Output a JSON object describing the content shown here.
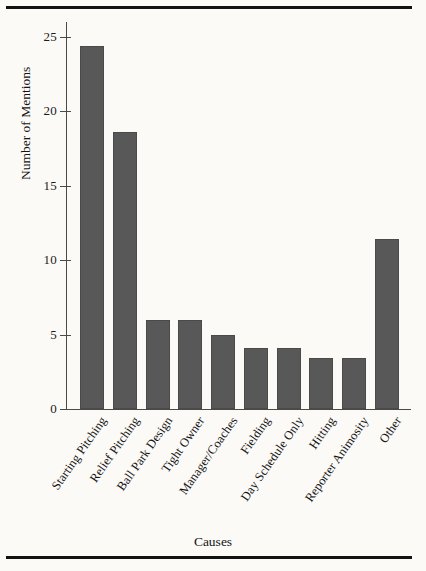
{
  "chart_data": {
    "type": "bar",
    "title": "",
    "xlabel": "Causes",
    "ylabel": "Number of Mentions",
    "categories": [
      "Starting Pitching",
      "Relief Pitching",
      "Ball Park Design",
      "Tight Owner",
      "Manager/Coaches",
      "Fielding",
      "Day Schedule Only",
      "Hitting",
      "Reporter Animosity",
      "Other"
    ],
    "values": [
      24.4,
      18.6,
      6.0,
      6.0,
      5.0,
      4.1,
      4.1,
      3.4,
      3.4,
      11.4
    ],
    "ylim": [
      0,
      26
    ],
    "yticks": [
      0,
      5,
      10,
      15,
      20,
      25
    ],
    "ytick_labels": [
      "0",
      "5",
      "10",
      "15",
      "20",
      "25"
    ],
    "grid": false,
    "legend": false,
    "bar_color": "#585858",
    "bar_edge_color": "#4a4a4a",
    "axis_color": "#4a4a4a",
    "background_color": "#fbfaf7",
    "rule_color": "#121212"
  }
}
